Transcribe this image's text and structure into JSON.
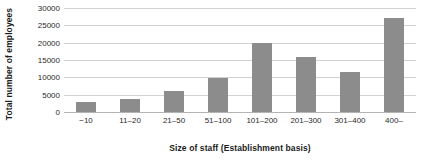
{
  "chart_data": {
    "type": "bar",
    "title": "",
    "subtitle": "",
    "xlabel": "Size of staff (Establishment basis)",
    "ylabel": "Total number of employees",
    "categories": [
      "−10",
      "11–20",
      "21–50",
      "51–100",
      "101–200",
      "201–300",
      "301–400",
      "400–"
    ],
    "values": [
      2800,
      3800,
      6000,
      9800,
      20000,
      16000,
      11500,
      27000
    ],
    "ylim": [
      0,
      30000
    ],
    "ytick_values": [
      0,
      5000,
      10000,
      15000,
      20000,
      25000,
      30000
    ],
    "ytick_labels": [
      "0",
      "5000",
      "10000",
      "15000",
      "20000",
      "25000",
      "30000"
    ],
    "grid": "horizontal",
    "legend": "none",
    "bar_color": "#8c8c8c",
    "gridline_color": "#d2d2d2",
    "axis_color": "#b4b4b4",
    "text_color": "#2b2b2b",
    "background_color": "#ffffff",
    "annotations": []
  }
}
